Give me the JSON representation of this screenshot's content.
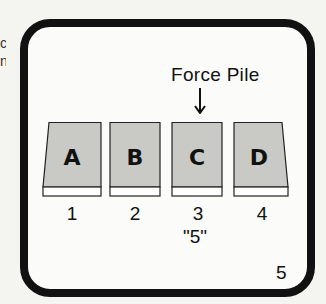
{
  "diagram": {
    "title": "Force Pile",
    "arrow_icon": "down-arrow",
    "cards": [
      {
        "letter": "A",
        "position": "1"
      },
      {
        "letter": "B",
        "position": "2"
      },
      {
        "letter": "C",
        "position": "3"
      },
      {
        "letter": "D",
        "position": "4"
      }
    ],
    "forced_value": "\"5\"",
    "page_number": "5",
    "edge_text": "c n"
  },
  "colors": {
    "frame": "#111111",
    "card_face": "#c9c9c6",
    "card_base": "#ffffff",
    "background": "#f4f4f1"
  }
}
